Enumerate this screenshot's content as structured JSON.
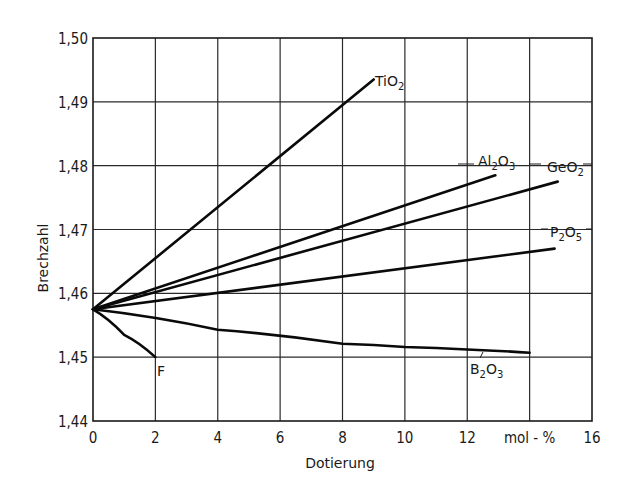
{
  "chart_data": {
    "type": "line",
    "title": "",
    "xlabel": "Dotierung",
    "ylabel": "Brechzahl",
    "x_unit_label": "mol-%",
    "xlim": [
      0,
      16
    ],
    "ylim": [
      1.44,
      1.5
    ],
    "grid": true,
    "legend_position": "inline labels at line ends",
    "x_ticks": [
      "0",
      "2",
      "4",
      "6",
      "8",
      "10",
      "12",
      "mol - %",
      "16"
    ],
    "y_ticks": [
      "1,44",
      "1,45",
      "1,46",
      "1,47",
      "1,48",
      "1,49",
      "1,50"
    ],
    "series": [
      {
        "name": "TiO2",
        "label": "TiO",
        "sub": "2",
        "points": [
          [
            0,
            1.4575
          ],
          [
            9,
            1.4935
          ]
        ]
      },
      {
        "name": "Al2O3",
        "label_parts": [
          "Al",
          "2",
          "O",
          "3"
        ],
        "points": [
          [
            0,
            1.4575
          ],
          [
            12.9,
            1.4785
          ]
        ]
      },
      {
        "name": "GeO2",
        "label_parts": [
          "GeO",
          "2"
        ],
        "points": [
          [
            0,
            1.4575
          ],
          [
            14.9,
            1.4775
          ]
        ]
      },
      {
        "name": "P2O5",
        "label_parts": [
          "P",
          "2",
          "O",
          "5"
        ],
        "points": [
          [
            0,
            1.4575
          ],
          [
            14.8,
            1.467
          ]
        ]
      },
      {
        "name": "B2O3",
        "label_parts": [
          "B",
          "2",
          "O",
          "3"
        ],
        "points": [
          [
            0,
            1.4575
          ],
          [
            4,
            1.4543
          ],
          [
            8,
            1.4521
          ],
          [
            10,
            1.4516
          ],
          [
            12,
            1.4512
          ],
          [
            14,
            1.4507
          ]
        ]
      },
      {
        "name": "F",
        "label_parts": [
          "F"
        ],
        "points": [
          [
            0,
            1.4575
          ],
          [
            1,
            1.4535
          ],
          [
            2,
            1.45
          ]
        ]
      }
    ]
  }
}
